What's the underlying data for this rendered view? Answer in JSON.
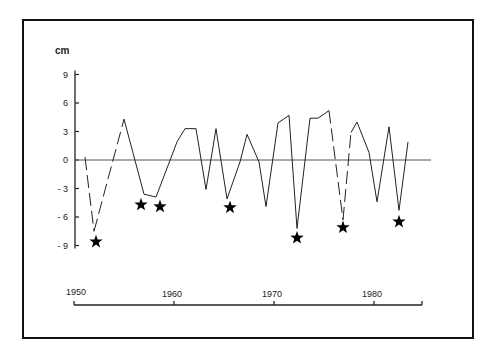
{
  "chart_data": {
    "type": "line",
    "title": "",
    "xlabel": "",
    "ylabel": "cm",
    "ylim": [
      -9,
      9
    ],
    "xlim": [
      1950,
      1985
    ],
    "yticks": [
      "9",
      "6",
      "3",
      "0",
      "- 3",
      "- 6",
      "- 9"
    ],
    "ytick_values": [
      9,
      6,
      3,
      0,
      -3,
      -6,
      -9
    ],
    "xticks": [
      "1950",
      "1960",
      "1970",
      "1980"
    ],
    "xtick_values": [
      1950,
      1960,
      1970,
      1980
    ],
    "grid": false,
    "zero_line": true,
    "series": [
      {
        "name": "deviation",
        "x": [
          1951.1,
          1952.0,
          1955.0,
          1957.0,
          1958.2,
          1960.3,
          1961.1,
          1962.2,
          1963.2,
          1964.2,
          1965.3,
          1966.6,
          1967.3,
          1968.5,
          1969.2,
          1970.4,
          1971.5,
          1972.3,
          1973.6,
          1974.4,
          1975.5,
          1976.9,
          1977.7,
          1978.3,
          1979.5,
          1980.3,
          1981.5,
          1982.5,
          1983.4
        ],
        "values": [
          0.3,
          -7.5,
          4.3,
          -3.6,
          -3.9,
          1.9,
          3.3,
          3.3,
          -3.1,
          3.3,
          -4.1,
          -0.2,
          2.7,
          -0.2,
          -4.9,
          3.9,
          4.7,
          -7.2,
          4.4,
          4.4,
          5.2,
          -6.3,
          2.9,
          4.0,
          0.8,
          -4.4,
          3.5,
          -5.3,
          1.9
        ],
        "dashed_segments": [
          [
            0,
            1
          ],
          [
            1,
            2
          ],
          [
            20,
            21
          ],
          [
            21,
            22
          ]
        ],
        "gap_segments": [
          [
            18,
            19
          ]
        ]
      }
    ],
    "markers": {
      "symbol": "star",
      "description": "star markers below marked minima",
      "points": [
        {
          "x": 1952.2,
          "y": -8.6
        },
        {
          "x": 1956.7,
          "y": -4.7
        },
        {
          "x": 1958.6,
          "y": -4.9
        },
        {
          "x": 1965.6,
          "y": -5.0
        },
        {
          "x": 1972.3,
          "y": -8.2
        },
        {
          "x": 1976.9,
          "y": -7.1
        },
        {
          "x": 1982.5,
          "y": -6.5
        }
      ]
    }
  },
  "colors": {
    "line": "#222222",
    "frame": "#111111",
    "marker": "#000000"
  }
}
